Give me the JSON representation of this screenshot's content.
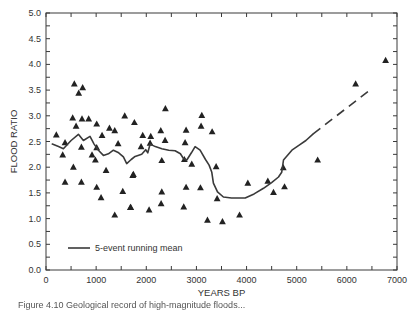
{
  "chart_data": {
    "type": "scatter",
    "title": "",
    "xlabel": "YEARS BP",
    "ylabel": "FLOOD RATIO",
    "xlim": [
      0,
      7000
    ],
    "ylim": [
      0,
      5.0
    ],
    "x_ticks": [
      0,
      1000,
      2000,
      3000,
      4000,
      5000,
      6000,
      7000
    ],
    "x_tick_labels": [
      "0",
      "1000",
      "2000",
      "3000",
      "4000",
      "5000",
      "6000",
      "7000"
    ],
    "x_minor_step": 500,
    "y_ticks": [
      0,
      0.5,
      1.0,
      1.5,
      2.0,
      2.5,
      3.0,
      3.5,
      4.0,
      4.5,
      5.0
    ],
    "y_tick_labels": [
      "0.0",
      "0.5",
      "1.0",
      "1.5",
      "2.0",
      "2.5",
      "3.0",
      "3.5",
      "4.0",
      "4.5",
      "5.0"
    ],
    "y_minor_step": 0.25,
    "grid": false,
    "legend": {
      "position": "bottom-left",
      "entries": [
        {
          "label": "5-event running mean",
          "style": "solid-line"
        }
      ]
    },
    "series": [
      {
        "name": "flood events",
        "marker": "triangle",
        "points": [
          [
            206,
            2.63
          ],
          [
            380,
            2.48
          ],
          [
            333,
            2.24
          ],
          [
            600,
            2.8
          ],
          [
            706,
            2.39
          ],
          [
            546,
            2.0
          ],
          [
            380,
            1.71
          ],
          [
            706,
            1.71
          ],
          [
            1011,
            2.84
          ],
          [
            1118,
            2.62
          ],
          [
            1265,
            2.76
          ],
          [
            1371,
            2.71
          ],
          [
            1438,
            2.46
          ],
          [
            918,
            2.24
          ],
          [
            985,
            2.14
          ],
          [
            1198,
            1.94
          ],
          [
            1011,
            1.61
          ],
          [
            1098,
            1.41
          ],
          [
            1531,
            1.53
          ],
          [
            1371,
            1.07
          ],
          [
            1690,
            1.22
          ],
          [
            1743,
            1.86
          ],
          [
            1011,
            2.38
          ],
          [
            565,
            3.62
          ],
          [
            731,
            3.55
          ],
          [
            652,
            3.44
          ],
          [
            532,
            2.96
          ],
          [
            718,
            2.94
          ],
          [
            851,
            2.94
          ],
          [
            1570,
            3.0
          ],
          [
            1763,
            2.87
          ],
          [
            2381,
            3.14
          ],
          [
            3107,
            3.01
          ],
          [
            3093,
            2.8
          ],
          [
            3313,
            2.69
          ],
          [
            1929,
            2.62
          ],
          [
            2089,
            2.6
          ],
          [
            2289,
            2.71
          ],
          [
            2794,
            2.72
          ],
          [
            2375,
            2.52
          ],
          [
            2774,
            2.48
          ],
          [
            1896,
            2.4
          ],
          [
            2076,
            2.47
          ],
          [
            2309,
            2.13
          ],
          [
            2760,
            2.15
          ],
          [
            2907,
            2.06
          ],
          [
            3393,
            2.01
          ],
          [
            1730,
            1.84
          ],
          [
            2309,
            1.52
          ],
          [
            2794,
            1.61
          ],
          [
            3080,
            1.6
          ],
          [
            2296,
            1.29
          ],
          [
            2747,
            1.23
          ],
          [
            1683,
            1.22
          ],
          [
            2056,
            1.17
          ],
          [
            3413,
            1.39
          ],
          [
            3220,
            0.97
          ],
          [
            3519,
            0.94
          ],
          [
            3860,
            1.07
          ],
          [
            4025,
            1.69
          ],
          [
            4424,
            1.73
          ],
          [
            4757,
            1.62
          ],
          [
            4537,
            1.51
          ],
          [
            4732,
            1.99
          ],
          [
            5418,
            2.14
          ],
          [
            6175,
            3.62
          ],
          [
            6773,
            4.08
          ]
        ]
      },
      {
        "name": "5-event running mean",
        "style": "solid",
        "points": [
          [
            126,
            2.45
          ],
          [
            250,
            2.4
          ],
          [
            347,
            2.36
          ],
          [
            500,
            2.52
          ],
          [
            646,
            2.64
          ],
          [
            746,
            2.52
          ],
          [
            878,
            2.6
          ],
          [
            960,
            2.45
          ],
          [
            1045,
            2.33
          ],
          [
            1145,
            2.23
          ],
          [
            1245,
            2.26
          ],
          [
            1345,
            2.33
          ],
          [
            1450,
            2.28
          ],
          [
            1544,
            2.2
          ],
          [
            1610,
            2.07
          ],
          [
            1700,
            2.15
          ],
          [
            1776,
            2.21
          ],
          [
            1909,
            2.25
          ],
          [
            1989,
            2.34
          ],
          [
            2030,
            2.28
          ],
          [
            2076,
            2.45
          ],
          [
            2180,
            2.4
          ],
          [
            2309,
            2.36
          ],
          [
            2450,
            2.33
          ],
          [
            2575,
            2.32
          ],
          [
            2680,
            2.26
          ],
          [
            2741,
            2.17
          ],
          [
            2807,
            2.14
          ],
          [
            2900,
            2.28
          ],
          [
            2973,
            2.4
          ],
          [
            3073,
            2.33
          ],
          [
            3180,
            2.15
          ],
          [
            3253,
            2.04
          ],
          [
            3306,
            1.9
          ],
          [
            3339,
            1.69
          ],
          [
            3420,
            1.52
          ],
          [
            3538,
            1.42
          ],
          [
            3700,
            1.4
          ],
          [
            3972,
            1.4
          ],
          [
            4150,
            1.48
          ],
          [
            4337,
            1.59
          ],
          [
            4500,
            1.7
          ],
          [
            4637,
            1.81
          ],
          [
            4700,
            1.9
          ],
          [
            4737,
            2.14
          ],
          [
            4903,
            2.33
          ],
          [
            5050,
            2.43
          ],
          [
            5183,
            2.52
          ],
          [
            5329,
            2.65
          ]
        ]
      },
      {
        "name": "running mean extrapolation",
        "style": "dashed",
        "points": [
          [
            5329,
            2.65
          ],
          [
            6473,
            3.51
          ]
        ]
      }
    ]
  },
  "caption": "Figure 4.10  Geological record of high-magnitude floods..."
}
